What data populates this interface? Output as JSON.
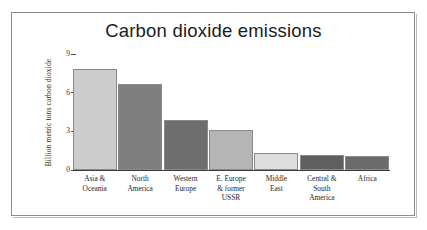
{
  "chart_data": {
    "type": "bar",
    "title": "Carbon dioxide emissions",
    "xlabel": "",
    "ylabel": "Billion metric tons carbon dioxide",
    "ylim": [
      0,
      9
    ],
    "yticks": [
      "0",
      "3",
      "6",
      "9"
    ],
    "ytick_values": [
      0,
      3,
      6,
      9
    ],
    "grid": false,
    "legend": "none",
    "categories": [
      "Asia & Oceania",
      "North America",
      "Western Europe",
      "E. Europe & former USSR",
      "Middle East",
      "Central & South America",
      "Africa"
    ],
    "category_lines": [
      [
        "Asia &",
        "Oceania"
      ],
      [
        "North",
        "America"
      ],
      [
        "Western",
        "Europe"
      ],
      [
        "E. Europe",
        "& former",
        "USSR"
      ],
      [
        "Middle",
        "East"
      ],
      [
        "Central &",
        "South",
        "America"
      ],
      [
        "Africa"
      ]
    ],
    "values": [
      7.8,
      6.7,
      3.9,
      3.1,
      1.3,
      1.15,
      1.1
    ],
    "bar_colors": [
      "#cdcdcd",
      "#7f7f7f",
      "#6e6e6e",
      "#b5b5b5",
      "#dedede",
      "#5f5f5f",
      "#6b6b6b"
    ],
    "bar_edge_color": "#8a8a8a",
    "axis_color": "#3d3d3d"
  },
  "style": {
    "frame_color": "#8d8d8d",
    "background": "#ffffff",
    "title_color": "#1b1b1b"
  }
}
